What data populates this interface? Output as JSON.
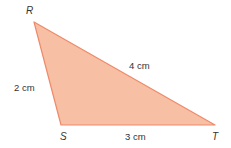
{
  "diagram": {
    "shape": "triangle",
    "fill_color": "#f7bfa4",
    "stroke_color": "#ee8a6a",
    "text_color": "#333333",
    "vertices": [
      {
        "name": "R",
        "x": 34,
        "y": 22
      },
      {
        "name": "S",
        "x": 61,
        "y": 125
      },
      {
        "name": "T",
        "x": 215,
        "y": 125
      }
    ],
    "sides": [
      {
        "between": "RS",
        "label": "2 cm"
      },
      {
        "between": "ST",
        "label": "3 cm"
      },
      {
        "between": "RT",
        "label": "4 cm"
      }
    ]
  }
}
